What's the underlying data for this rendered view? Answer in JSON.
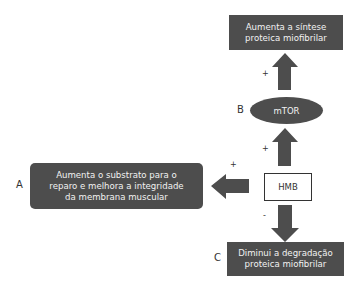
{
  "diagram": {
    "nodes": {
      "top": {
        "text_line1": "Aumenta a síntese",
        "text_line2": "proteica miofibrilar"
      },
      "mtor": {
        "label": "B",
        "text": "mTOR"
      },
      "left": {
        "label": "A",
        "text_line1": "Aumenta o substrato para o",
        "text_line2": "reparo e melhora a integridade",
        "text_line3": "da membrana muscular"
      },
      "hmb": {
        "text": "HMB"
      },
      "bottom": {
        "label": "C",
        "text_line1": "Diminui a degradação",
        "text_line2": "proteica miofibrilar"
      }
    },
    "edges": [
      {
        "from": "HMB",
        "to": "mTOR",
        "sign": "+"
      },
      {
        "from": "mTOR",
        "to": "Aumenta a síntese proteica miofibrilar",
        "sign": "+"
      },
      {
        "from": "HMB",
        "to": "Aumenta o substrato para o reparo e melhora a integridade da membrana muscular",
        "sign": "+"
      },
      {
        "from": "HMB",
        "to": "Diminui a degradação proteica miofibrilar",
        "sign": "-"
      }
    ],
    "signs": {
      "top": "+",
      "middle": "+",
      "left": "+",
      "bottom": "-"
    },
    "colors": {
      "box_fill": "#4d4d4d",
      "arrow_fill": "#4d4d4d",
      "box_text": "#f2f2f2"
    }
  }
}
